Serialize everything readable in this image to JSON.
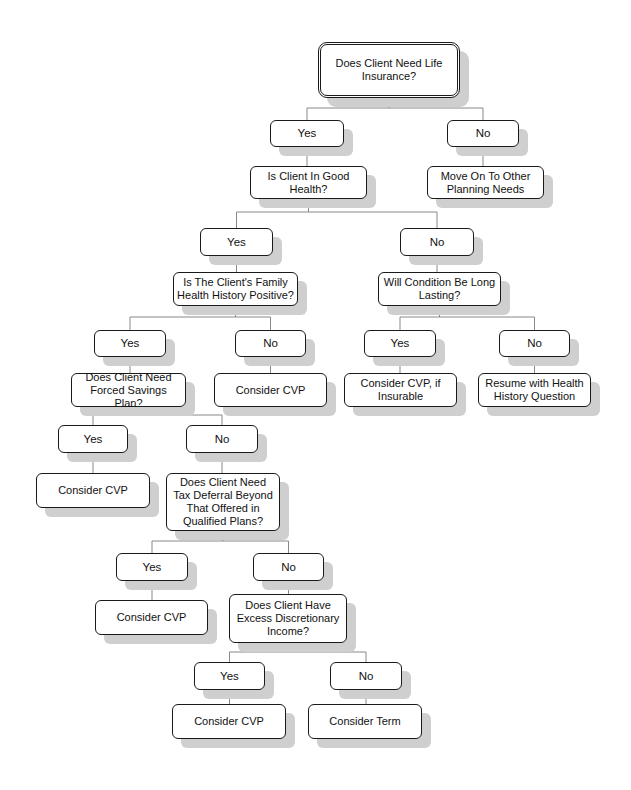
{
  "diagram": {
    "type": "decision-tree",
    "title": "Does Client Need Life Insurance?",
    "colors": {
      "border": "#1a1a1a",
      "shadow": "#cfcfcf",
      "connector": "#888888",
      "background": "#ffffff"
    },
    "nodes": [
      {
        "id": "root",
        "text": "Does Client Need Life Insurance?",
        "kind": "root",
        "x": 318,
        "y": 42,
        "w": 142,
        "h": 56
      },
      {
        "id": "yes1",
        "text": "Yes",
        "kind": "answer",
        "x": 270,
        "y": 120,
        "w": 74,
        "h": 27
      },
      {
        "id": "no1",
        "text": "No",
        "kind": "answer",
        "x": 447,
        "y": 120,
        "w": 72,
        "h": 27
      },
      {
        "id": "health",
        "text": "Is Client In Good Health?",
        "kind": "question",
        "x": 250,
        "y": 166,
        "w": 117,
        "h": 33
      },
      {
        "id": "moveon",
        "text": "Move On To Other Planning Needs",
        "kind": "outcome",
        "x": 427,
        "y": 166,
        "w": 117,
        "h": 33
      },
      {
        "id": "yes2",
        "text": "Yes",
        "kind": "answer",
        "x": 200,
        "y": 228,
        "w": 73,
        "h": 28
      },
      {
        "id": "no2",
        "text": "No",
        "kind": "answer",
        "x": 400,
        "y": 228,
        "w": 74,
        "h": 28
      },
      {
        "id": "family",
        "text": "Is The Client's Family Health History Positive?",
        "kind": "question",
        "x": 173,
        "y": 272,
        "w": 125,
        "h": 34
      },
      {
        "id": "longlasting",
        "text": "Will Condition Be Long Lasting?",
        "kind": "question",
        "x": 378,
        "y": 272,
        "w": 123,
        "h": 34
      },
      {
        "id": "yes3a",
        "text": "Yes",
        "kind": "answer",
        "x": 94,
        "y": 330,
        "w": 72,
        "h": 27
      },
      {
        "id": "no3a",
        "text": "No",
        "kind": "answer",
        "x": 235,
        "y": 330,
        "w": 71,
        "h": 27
      },
      {
        "id": "yes3b",
        "text": "Yes",
        "kind": "answer",
        "x": 364,
        "y": 330,
        "w": 72,
        "h": 27
      },
      {
        "id": "no3b",
        "text": "No",
        "kind": "answer",
        "x": 499,
        "y": 330,
        "w": 71,
        "h": 27
      },
      {
        "id": "forced",
        "text": "Does Client Need Forced Savings Plan?",
        "kind": "question",
        "x": 71,
        "y": 373,
        "w": 115,
        "h": 34
      },
      {
        "id": "cvp1",
        "text": "Consider CVP",
        "kind": "outcome",
        "x": 214,
        "y": 373,
        "w": 113,
        "h": 34
      },
      {
        "id": "cvpins",
        "text": "Consider CVP, if Insurable",
        "kind": "outcome",
        "x": 344,
        "y": 373,
        "w": 113,
        "h": 34
      },
      {
        "id": "resume",
        "text": "Resume with Health History Question",
        "kind": "outcome",
        "x": 478,
        "y": 373,
        "w": 113,
        "h": 34
      },
      {
        "id": "yes4",
        "text": "Yes",
        "kind": "answer",
        "x": 58,
        "y": 425,
        "w": 70,
        "h": 28
      },
      {
        "id": "no4",
        "text": "No",
        "kind": "answer",
        "x": 186,
        "y": 425,
        "w": 72,
        "h": 28
      },
      {
        "id": "cvp2",
        "text": "Consider CVP",
        "kind": "outcome",
        "x": 36,
        "y": 473,
        "w": 114,
        "h": 35
      },
      {
        "id": "taxdeferral",
        "text": "Does Client Need Tax Deferral Beyond That Offered in Qualified Plans?",
        "kind": "question",
        "x": 166,
        "y": 473,
        "w": 114,
        "h": 58
      },
      {
        "id": "yes5",
        "text": "Yes",
        "kind": "answer",
        "x": 116,
        "y": 553,
        "w": 72,
        "h": 28
      },
      {
        "id": "no5",
        "text": "No",
        "kind": "answer",
        "x": 253,
        "y": 553,
        "w": 71,
        "h": 28
      },
      {
        "id": "cvp3",
        "text": "Consider CVP",
        "kind": "outcome",
        "x": 95,
        "y": 600,
        "w": 113,
        "h": 35
      },
      {
        "id": "excess",
        "text": "Does Client Have Excess Discretionary Income?",
        "kind": "question",
        "x": 229,
        "y": 594,
        "w": 118,
        "h": 49
      },
      {
        "id": "yes6",
        "text": "Yes",
        "kind": "answer",
        "x": 194,
        "y": 662,
        "w": 71,
        "h": 28
      },
      {
        "id": "no6",
        "text": "No",
        "kind": "answer",
        "x": 330,
        "y": 662,
        "w": 72,
        "h": 28
      },
      {
        "id": "cvp4",
        "text": "Consider CVP",
        "kind": "outcome",
        "x": 172,
        "y": 704,
        "w": 114,
        "h": 35
      },
      {
        "id": "term",
        "text": "Consider Term",
        "kind": "outcome",
        "x": 308,
        "y": 704,
        "w": 114,
        "h": 35
      }
    ],
    "edges": [
      [
        "root",
        "yes1"
      ],
      [
        "root",
        "no1"
      ],
      [
        "yes1",
        "health"
      ],
      [
        "no1",
        "moveon"
      ],
      [
        "health",
        "yes2"
      ],
      [
        "health",
        "no2"
      ],
      [
        "yes2",
        "family"
      ],
      [
        "no2",
        "longlasting"
      ],
      [
        "family",
        "yes3a"
      ],
      [
        "family",
        "no3a"
      ],
      [
        "longlasting",
        "yes3b"
      ],
      [
        "longlasting",
        "no3b"
      ],
      [
        "yes3a",
        "forced"
      ],
      [
        "no3a",
        "cvp1"
      ],
      [
        "yes3b",
        "cvpins"
      ],
      [
        "no3b",
        "resume"
      ],
      [
        "forced",
        "yes4"
      ],
      [
        "forced",
        "no4"
      ],
      [
        "yes4",
        "cvp2"
      ],
      [
        "no4",
        "taxdeferral"
      ],
      [
        "taxdeferral",
        "yes5"
      ],
      [
        "taxdeferral",
        "no5"
      ],
      [
        "yes5",
        "cvp3"
      ],
      [
        "no5",
        "excess"
      ],
      [
        "excess",
        "yes6"
      ],
      [
        "excess",
        "no6"
      ],
      [
        "yes6",
        "cvp4"
      ],
      [
        "no6",
        "term"
      ]
    ]
  }
}
